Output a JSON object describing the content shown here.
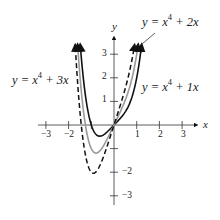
{
  "chart_data": {
    "type": "line",
    "title": "",
    "xlabel": "x",
    "ylabel": "y",
    "xlim": [
      -3.2,
      3.5
    ],
    "ylim": [
      -3.3,
      3.3
    ],
    "grid": false,
    "x_ticks": [
      -3,
      -2,
      -1,
      1,
      2,
      3
    ],
    "x_tick_labels": [
      "−3",
      "−2",
      "",
      "1",
      "2",
      "3"
    ],
    "y_ticks": [
      -3,
      -2,
      -1,
      1,
      2,
      3
    ],
    "y_tick_labels": [
      "−3",
      "−2",
      "",
      "1",
      "2",
      "3"
    ],
    "series": [
      {
        "name": "y = x^4 + 1x",
        "a": 1,
        "style": "solid",
        "color": "#111111",
        "minimum": {
          "x": -0.63,
          "y": -0.47
        }
      },
      {
        "name": "y = x^4 + 2x",
        "a": 2,
        "style": "solid",
        "color": "#9a9a9a",
        "minimum": {
          "x": -0.79,
          "y": -1.19
        }
      },
      {
        "name": "y = x^4 + 3x",
        "a": 3,
        "style": "dashed",
        "color": "#111111",
        "minimum": {
          "x": -0.91,
          "y": -2.04
        }
      }
    ],
    "annotations": [
      {
        "text": "y = x^4 + 2x",
        "position": "top-right",
        "pointer": true
      },
      {
        "text": "y = x^4 + 3x",
        "position": "left"
      },
      {
        "text": "y = x^4 + 1x",
        "position": "right"
      }
    ]
  },
  "labels": {
    "axis_x": "x",
    "axis_y": "y",
    "ticks_x": {
      "m3": "−3",
      "m2": "−2",
      "p1": "1",
      "p2": "2",
      "p3": "3"
    },
    "ticks_y": {
      "p3": "3",
      "p2": "2",
      "p1": "1",
      "m2": "−2",
      "m3": "−3"
    },
    "eq_2x": {
      "lhs": "y = x",
      "exp": "4",
      "rhs": " + 2x"
    },
    "eq_3x": {
      "lhs": "y = x",
      "exp": "4",
      "rhs": " + 3x"
    },
    "eq_1x": {
      "lhs": "y = x",
      "exp": "4",
      "rhs": " + 1x"
    }
  }
}
